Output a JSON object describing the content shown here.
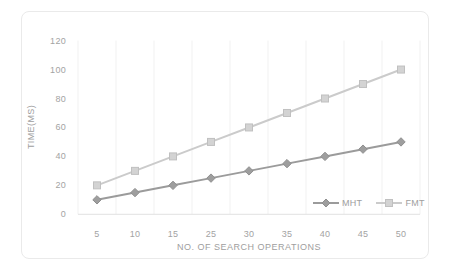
{
  "chart_data": {
    "type": "line",
    "title": "",
    "xlabel": "NO. OF SEARCH OPERATIONS",
    "ylabel": "TIME(MS)",
    "categories": [
      "5",
      "10",
      "15",
      "25",
      "30",
      "35",
      "40",
      "45",
      "50"
    ],
    "y_ticks": [
      0,
      20,
      40,
      60,
      80,
      100,
      120
    ],
    "ylim": [
      0,
      120
    ],
    "grid": "vertical-only",
    "legend_position": "inside-bottom-right",
    "series": [
      {
        "name": "MHT",
        "values": [
          10,
          15,
          20,
          25,
          30,
          35,
          40,
          45,
          50
        ],
        "color": "#9b9b9b",
        "marker_fill": "#9e9e9e",
        "marker_edge": "#8f8f8f",
        "marker": "diamond"
      },
      {
        "name": "FMT",
        "values": [
          20,
          30,
          40,
          50,
          60,
          70,
          80,
          90,
          100
        ],
        "color": "#cbcbcb",
        "marker_fill": "#d3d3d3",
        "marker_edge": "#c0c0c0",
        "marker": "square"
      }
    ]
  },
  "colors": {
    "background": "#ffffff",
    "card_border": "#eaeaea",
    "gridline": "#f1f1f1",
    "axis_line": "#e2e2e2",
    "tick_text": "#a3a3a3",
    "axis_title_text": "#9e9e9e"
  }
}
